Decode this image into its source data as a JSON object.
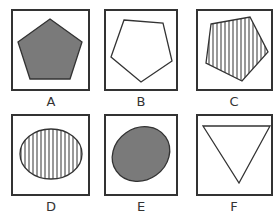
{
  "colors": {
    "stroke": "#333333",
    "fill_gray": "#7a7a7a",
    "background": "#ffffff"
  },
  "options": [
    {
      "label": "A",
      "shape": "pentagon",
      "fill": "solid gray"
    },
    {
      "label": "B",
      "shape": "pentagon",
      "fill": "none"
    },
    {
      "label": "C",
      "shape": "pentagon",
      "fill": "vertical stripes"
    },
    {
      "label": "D",
      "shape": "ellipse",
      "fill": "vertical stripes"
    },
    {
      "label": "E",
      "shape": "ellipse",
      "fill": "solid gray"
    },
    {
      "label": "F",
      "shape": "inverted triangle",
      "fill": "none"
    }
  ]
}
